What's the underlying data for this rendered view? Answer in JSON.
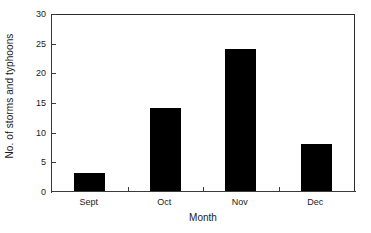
{
  "chart_data": {
    "type": "bar",
    "title": "",
    "xlabel": "Month",
    "ylabel": "No. of storms and typhoons",
    "categories": [
      "Sept",
      "Oct",
      "Nov",
      "Dec"
    ],
    "values": [
      3,
      14,
      24,
      8
    ],
    "ylim": [
      0,
      30
    ],
    "ytick_values": [
      0,
      5,
      10,
      15,
      20,
      25,
      30
    ],
    "ytick_labels": [
      "0",
      "5",
      "10",
      "15",
      "20",
      "25",
      "30"
    ],
    "grid": false,
    "legend": false,
    "bar_color": "#000000",
    "axis_color": "#3a3a3a",
    "background_color": "#ffffff",
    "frame": true,
    "series": [
      {
        "name": "No. of storms and typhoons",
        "values": [
          3,
          14,
          24,
          8
        ]
      }
    ]
  }
}
